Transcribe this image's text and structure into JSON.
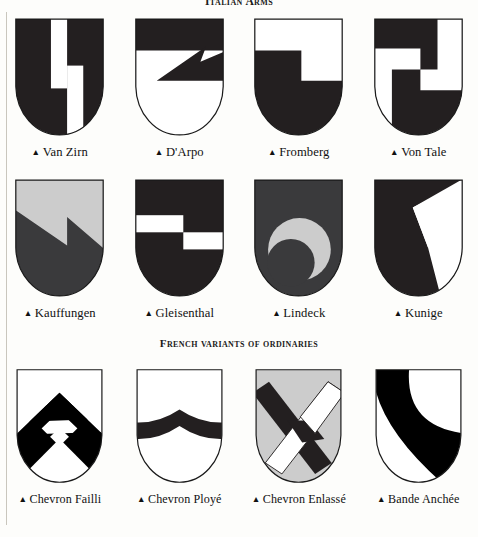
{
  "page": {
    "background": "#fdfdfb",
    "sable": "#231f20",
    "argent": "#ffffff",
    "grey": "#cccccc",
    "outline": "#1a1a1a"
  },
  "sections": {
    "top_title": "Italian Arms",
    "french_title": "French variants of ordinaries"
  },
  "bullet": "▲",
  "rows": [
    {
      "name": "row-italian-arms-1",
      "shields": [
        {
          "caption": "Van Zirn",
          "charge": "two-offset-pallets",
          "field": "#231f20",
          "charge_color": "#ffffff",
          "icon": "shield-van-zirn"
        },
        {
          "caption": "D'Arpo",
          "charge": "chief-with-zigzag-point",
          "field": "#ffffff",
          "charge_color": "#231f20",
          "icon": "shield-darpo"
        },
        {
          "caption": "Fromberg",
          "charge": "stepped-base",
          "field": "#ffffff",
          "charge_color": "#231f20",
          "icon": "shield-fromberg"
        },
        {
          "caption": "Von Tale",
          "charge": "interlocking-steps",
          "field": "#231f20",
          "charge_color": "#ffffff",
          "icon": "shield-von-tale"
        }
      ]
    },
    {
      "name": "row-italian-arms-2",
      "shields": [
        {
          "caption": "Kauffungen",
          "charge": "party-per-lightning-bolt",
          "field": "#cccccc",
          "charge_color": "#3a3a3c",
          "icon": "shield-kauffungen"
        },
        {
          "caption": "Gleisenthal",
          "charge": "two-offset-fesses",
          "field": "#231f20",
          "charge_color": "#ffffff",
          "icon": "shield-gleisenthal"
        },
        {
          "caption": "Lindeck",
          "charge": "crescent-roundel",
          "field": "#3a3a3c",
          "charge_color": "#cccccc",
          "icon": "shield-lindeck"
        },
        {
          "caption": "Kunige",
          "charge": "inverted-wedge",
          "field": "#231f20",
          "charge_color": "#ffffff",
          "icon": "shield-kunige"
        }
      ]
    },
    {
      "name": "row-french-variants",
      "shields": [
        {
          "caption": "Chevron Failli",
          "charge": "broken-chevron",
          "field": "#ffffff",
          "charge_color": "#000000",
          "icon": "shield-chevron-failli"
        },
        {
          "caption": "Chevron Ployé",
          "charge": "curved-chevron",
          "field": "#ffffff",
          "charge_color": "#231f20",
          "icon": "shield-chevron-ploye"
        },
        {
          "caption": "Chevron Enlassé",
          "charge": "interlaced-chevrons",
          "field": "#cccccc",
          "charge_color": "#231f20",
          "icon": "shield-chevron-enlasse"
        },
        {
          "caption": "Bande Anchée",
          "charge": "arched-bend",
          "field": "#ffffff",
          "charge_color": "#000000",
          "icon": "shield-bande-anchee"
        }
      ]
    }
  ]
}
